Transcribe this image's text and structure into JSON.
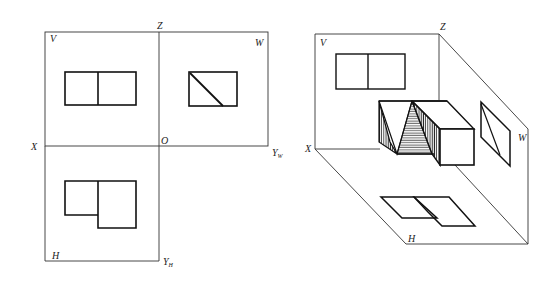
{
  "orthographic_view": {
    "labels": {
      "z": "Z",
      "v": "V",
      "w": "W",
      "x": "X",
      "o": "O",
      "yw": "Y",
      "yw_sub": "W",
      "h": "H",
      "yh": "Y",
      "yh_sub": "H"
    }
  },
  "pictorial_view": {
    "labels": {
      "z": "Z",
      "v": "V",
      "w": "W",
      "x": "X",
      "h": "H"
    }
  },
  "colors": {
    "line": "#222222",
    "background": "#ffffff"
  }
}
